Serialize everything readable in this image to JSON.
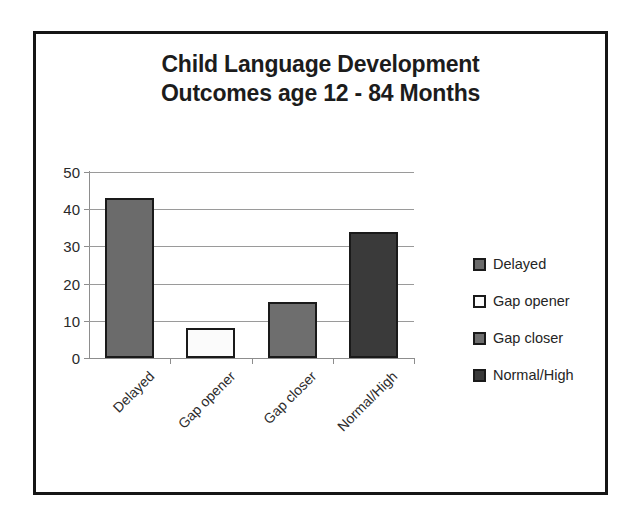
{
  "chart_data": {
    "type": "bar",
    "title": "Child Language Development Outcomes age 12 - 84 Months",
    "title_lines": [
      "Child Language Development",
      "Outcomes age 12 - 84 Months"
    ],
    "categories": [
      "Delayed",
      "Gap opener",
      "Gap closer",
      "Normal/High"
    ],
    "values": [
      43,
      8,
      15,
      34
    ],
    "bar_colors": [
      "#6b6b6b",
      "#fbfbfb",
      "#6e6e6e",
      "#3a3a3a"
    ],
    "xlabel": "",
    "ylabel": "",
    "ylim": [
      0,
      50
    ],
    "yticks": [
      0,
      10,
      20,
      30,
      40,
      50
    ],
    "ytick_labels": [
      "0",
      "10",
      "20",
      "30",
      "40",
      "50"
    ],
    "grid": true,
    "grid_axis": "y",
    "legend_position": "right",
    "legend": [
      {
        "label": "Delayed",
        "color": "#6b6b6b"
      },
      {
        "label": "Gap opener",
        "color": "#fbfbfb"
      },
      {
        "label": "Gap closer",
        "color": "#6e6e6e"
      },
      {
        "label": "Normal/High",
        "color": "#3a3a3a"
      }
    ],
    "xtick_label_rotation": -45,
    "frame_color": "#151515",
    "background_color": "#ffffff",
    "axis_color": "#8d8d8d",
    "bar_edge_color": "#1a1a1a"
  }
}
